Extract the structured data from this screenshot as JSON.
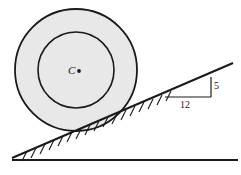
{
  "figure": {
    "type": "mechanics-diagram",
    "background_color": "#ffffff",
    "stroke_color": "#1a1a1a",
    "fill_color": "#e8e8e8"
  },
  "wheel": {
    "center_label": "C",
    "center_point_marker": "dot",
    "center_x": 76,
    "center_y": 70,
    "outer_radius": 61,
    "inner_radius": 38,
    "outer_fill": "#e8e8e8",
    "inner_fill": "#e8e8e8"
  },
  "incline": {
    "apex_x": 12,
    "apex_y": 158,
    "end_x": 233,
    "end_y": 63,
    "base_start_x": 12,
    "base_start_y": 160,
    "base_end_x": 238,
    "base_end_y": 160,
    "hatch_count": 17
  },
  "slope_triangle": {
    "rise_label": "5",
    "run_label": "12",
    "corner_x": 211,
    "corner_y": 97,
    "run_start_x": 165,
    "rise_top_y": 77
  }
}
